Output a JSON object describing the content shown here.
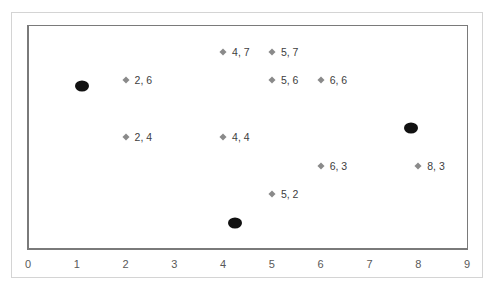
{
  "chart_data": {
    "type": "scatter",
    "title": "",
    "xlabel": "",
    "ylabel": "",
    "xlim": [
      0,
      9
    ],
    "ylim": [
      0,
      7.9
    ],
    "grid": false,
    "legend": null,
    "x_ticks": [
      "0",
      "1",
      "2",
      "3",
      "4",
      "5",
      "6",
      "7",
      "8",
      "9"
    ],
    "series": [
      {
        "name": "labeled points",
        "marker": "diamond",
        "color": "#8a8a8a",
        "points": [
          {
            "x": 4,
            "y": 7,
            "label": "4, 7"
          },
          {
            "x": 5,
            "y": 7,
            "label": "5, 7"
          },
          {
            "x": 2,
            "y": 6,
            "label": "2, 6"
          },
          {
            "x": 5,
            "y": 6,
            "label": "5, 6"
          },
          {
            "x": 6,
            "y": 6,
            "label": "6, 6"
          },
          {
            "x": 2,
            "y": 4,
            "label": "2, 4"
          },
          {
            "x": 4,
            "y": 4,
            "label": "4, 4"
          },
          {
            "x": 6,
            "y": 3,
            "label": "6, 3"
          },
          {
            "x": 8,
            "y": 3,
            "label": "8, 3"
          },
          {
            "x": 5,
            "y": 2,
            "label": "5, 2"
          }
        ]
      },
      {
        "name": "centroids",
        "marker": "circle",
        "color": "#111111",
        "points": [
          {
            "x": 1.1,
            "y": 5.8
          },
          {
            "x": 7.85,
            "y": 4.3
          },
          {
            "x": 4.25,
            "y": 1.0
          }
        ]
      }
    ]
  }
}
